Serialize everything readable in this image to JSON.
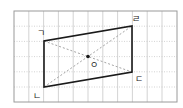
{
  "diagram": {
    "type": "parallelogram-on-grid",
    "grid": {
      "x0": 14,
      "y0": 11,
      "cols": 11,
      "rows": 6,
      "cell_w": 14.8,
      "cell_h": 15.2,
      "border_color": "#9a9a9a",
      "line_color": "#c8c8c8"
    },
    "vertices": [
      {
        "id": "giyeok",
        "label": "ㄱ",
        "x": 44,
        "y": 41,
        "label_x": 37,
        "label_y": 36
      },
      {
        "id": "nieun",
        "label": "ㄴ",
        "x": 44,
        "y": 87,
        "label_x": 33,
        "label_y": 99
      },
      {
        "id": "digeut",
        "label": "ㄷ",
        "x": 132,
        "y": 72,
        "label_x": 135,
        "label_y": 82
      },
      {
        "id": "rieul",
        "label": "ㄹ",
        "x": 132,
        "y": 26,
        "label_x": 132,
        "label_y": 22
      }
    ],
    "center": {
      "label": "ㅇ",
      "x": 88,
      "y": 56.5,
      "label_x": 90,
      "label_y": 68
    },
    "colors": {
      "shape": "#1a1a1a",
      "diagonal": "#9a9a9a",
      "point": "#1a1a1a"
    }
  }
}
